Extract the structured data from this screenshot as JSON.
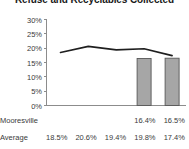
{
  "chart_data": {
    "type": "bar",
    "title": "Refuse and Recyclables Collected",
    "xlabel": "",
    "ylabel": "",
    "categories": [
      "2015",
      "2016",
      "2017",
      "2018",
      "2019"
    ],
    "ylim": [
      0,
      30
    ],
    "ytick_labels": [
      "0%",
      "5%",
      "10%",
      "15%",
      "20%",
      "25%",
      "30%"
    ],
    "ytick_values": [
      0,
      5,
      10,
      15,
      20,
      25,
      30
    ],
    "grid": false,
    "legend": "none",
    "series": [
      {
        "name": "Mooresville",
        "render": "bar",
        "values": [
          null,
          null,
          null,
          16.4,
          16.5
        ],
        "labels": [
          "",
          "",
          "",
          "16.4%",
          "16.5%"
        ],
        "fill": "#a6a6a6",
        "stroke": "#585858"
      },
      {
        "name": "Average",
        "render": "line",
        "values": [
          18.5,
          20.6,
          19.4,
          19.8,
          17.4
        ],
        "labels": [
          "18.5%",
          "20.6%",
          "19.4%",
          "19.8%",
          "17.4%"
        ],
        "stroke": "#1f1f1f"
      }
    ]
  },
  "title": {
    "text": "Refuse and Recyclables Collected"
  },
  "axes": {
    "y": {
      "ticks": [
        {
          "label": "30%",
          "value": 30
        },
        {
          "label": "25%",
          "value": 25
        },
        {
          "label": "20%",
          "value": 20
        },
        {
          "label": "15%",
          "value": 15
        },
        {
          "label": "10%",
          "value": 10
        },
        {
          "label": "5%",
          "value": 5
        },
        {
          "label": "0%",
          "value": 0
        }
      ]
    },
    "x": {
      "ticks": [
        {
          "label": "2015"
        },
        {
          "label": "2016"
        },
        {
          "label": "2017"
        },
        {
          "label": "2018"
        },
        {
          "label": "2019"
        }
      ]
    }
  },
  "table": {
    "rows": [
      {
        "label": "Mooresville",
        "cells": [
          "",
          "",
          "",
          "16.4%",
          "16.5%"
        ]
      },
      {
        "label": "Average",
        "cells": [
          "18.5%",
          "20.6%",
          "19.4%",
          "19.8%",
          "17.4%"
        ]
      }
    ]
  }
}
